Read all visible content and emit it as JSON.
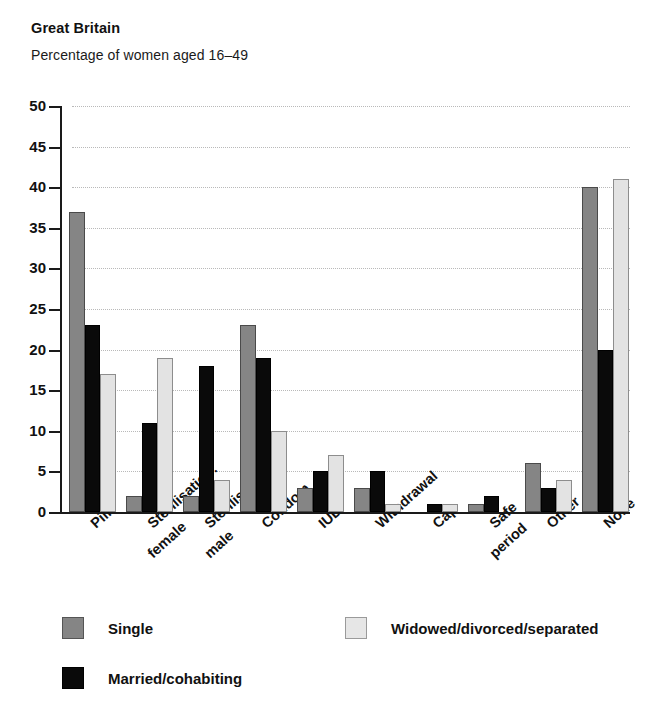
{
  "header": {
    "title": "Great Britain",
    "subtitle": "Percentage  of women aged 16–49"
  },
  "chart_data": {
    "type": "bar",
    "title": "Great Britain",
    "subtitle": "Percentage  of women aged 16–49",
    "xlabel": "",
    "ylabel": "",
    "ylim": [
      0,
      50
    ],
    "yticks": [
      0,
      5,
      10,
      15,
      20,
      25,
      30,
      35,
      40,
      45,
      50
    ],
    "ytick_labels": [
      "0",
      "5",
      "10",
      "15",
      "20",
      "25",
      "30",
      "35",
      "40",
      "45",
      "50"
    ],
    "grid": true,
    "legend_position": "bottom",
    "categories": [
      "Pill",
      "Sterilisation: female",
      "Sterilisation: male",
      "Condom",
      "IUD",
      "Withdrawal",
      "Cap",
      "Safe period",
      "Other",
      "None"
    ],
    "category_lines": [
      [
        "Pill"
      ],
      [
        "Sterilisation:",
        "female"
      ],
      [
        "Sterilisation:",
        "male"
      ],
      [
        "Condom"
      ],
      [
        "IUD"
      ],
      [
        "Withdrawal"
      ],
      [
        "Cap"
      ],
      [
        "Safe",
        "period"
      ],
      [
        "Other"
      ],
      [
        "None"
      ]
    ],
    "series": [
      {
        "name": "Single",
        "color": "#858585",
        "values": [
          37,
          2,
          2,
          23,
          3,
          3,
          0,
          1,
          6,
          40
        ]
      },
      {
        "name": "Married/cohabiting",
        "color": "#0a0a0a",
        "values": [
          23,
          11,
          18,
          19,
          5,
          5,
          1,
          2,
          3,
          20
        ]
      },
      {
        "name": "Widowed/divorced/separated",
        "color": "#e3e3e3",
        "values": [
          17,
          19,
          4,
          10,
          7,
          1,
          1,
          0,
          4,
          41
        ]
      }
    ]
  },
  "legend": {
    "items": [
      {
        "label": "Single",
        "key": "single"
      },
      {
        "label": "Widowed/divorced/separated",
        "key": "widowed"
      },
      {
        "label": "Married/cohabiting",
        "key": "married"
      }
    ]
  }
}
